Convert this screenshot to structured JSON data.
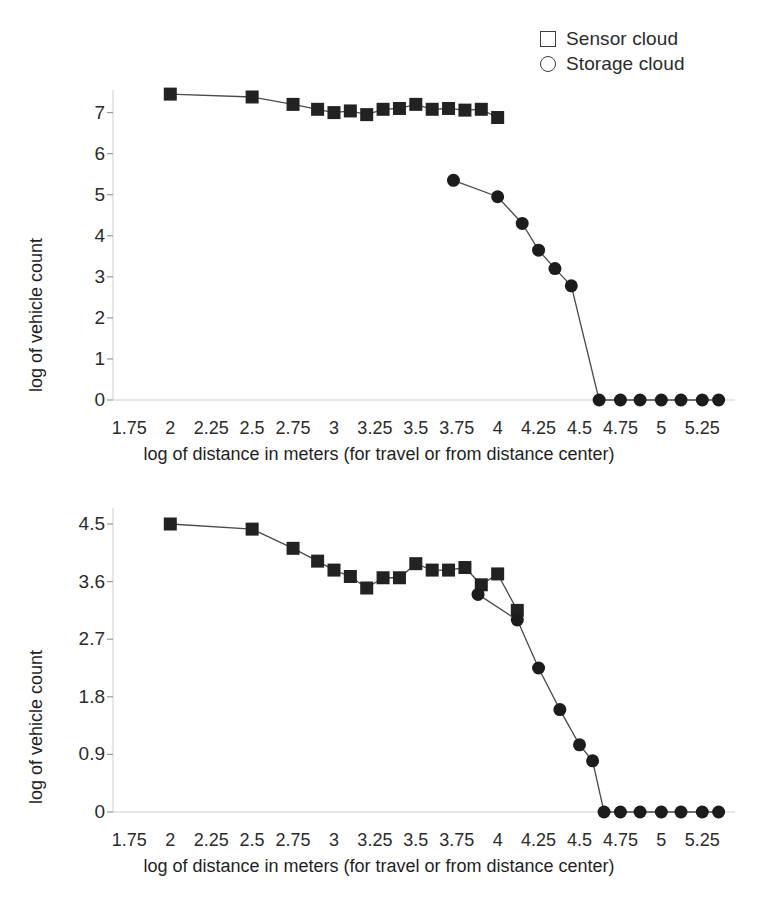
{
  "legend": {
    "position": "top-right",
    "items": [
      {
        "marker": "square-outline-icon",
        "label": "Sensor cloud"
      },
      {
        "marker": "circle-outline-icon",
        "label": "Storage cloud"
      }
    ]
  },
  "chart_data": [
    {
      "id": "top",
      "type": "line",
      "title": "",
      "xlabel": "log of distance in meters (for travel or from distance center)",
      "ylabel": "log of vehicle count",
      "xlim": [
        1.65,
        5.45
      ],
      "ylim": [
        0,
        7.55
      ],
      "xticks": [
        1.75,
        2,
        2.25,
        2.5,
        2.75,
        3,
        3.25,
        3.5,
        3.75,
        4,
        4.25,
        4.5,
        4.75,
        5,
        5.25
      ],
      "xtick_labels": [
        "1.75",
        "2",
        "2.25",
        "2.5",
        "2.75",
        "3",
        "3.25",
        "3.5",
        "3.75",
        "4",
        "4.25",
        "4.5",
        "4.75",
        "5",
        "5.25"
      ],
      "yticks": [
        0,
        1,
        2,
        3,
        4,
        5,
        6,
        7
      ],
      "ytick_labels": [
        "0",
        "1",
        "2",
        "3",
        "4",
        "5",
        "6",
        "7"
      ],
      "grid": false,
      "series": [
        {
          "name": "Sensor cloud",
          "marker": "square",
          "x": [
            2.0,
            2.5,
            2.75,
            2.9,
            3.0,
            3.1,
            3.2,
            3.3,
            3.4,
            3.5,
            3.6,
            3.7,
            3.8,
            3.9,
            4.0
          ],
          "y": [
            7.45,
            7.38,
            7.2,
            7.08,
            7.0,
            7.04,
            6.95,
            7.08,
            7.1,
            7.2,
            7.08,
            7.1,
            7.06,
            7.08,
            6.88
          ]
        },
        {
          "name": "Storage cloud",
          "marker": "circle",
          "x": [
            3.73,
            4.0,
            4.15,
            4.25,
            4.35,
            4.45,
            4.62,
            4.75,
            4.87,
            5.0,
            5.12,
            5.25,
            5.35
          ],
          "y": [
            5.35,
            4.95,
            4.3,
            3.65,
            3.2,
            2.78,
            0.0,
            0.0,
            0.0,
            0.0,
            0.0,
            0.0,
            0.0
          ]
        }
      ]
    },
    {
      "id": "bottom",
      "type": "line",
      "title": "",
      "xlabel": "log of distance in meters (for travel or from distance center)",
      "ylabel": "log of vehicle count",
      "xlim": [
        1.65,
        5.45
      ],
      "ylim": [
        0,
        4.75
      ],
      "xticks": [
        1.75,
        2,
        2.25,
        2.5,
        2.75,
        3,
        3.25,
        3.5,
        3.75,
        4,
        4.25,
        4.5,
        4.75,
        5,
        5.25
      ],
      "xtick_labels": [
        "1.75",
        "2",
        "2.25",
        "2.5",
        "2.75",
        "3",
        "3.25",
        "3.5",
        "3.75",
        "4",
        "4.25",
        "4.5",
        "4.75",
        "5",
        "5.25"
      ],
      "yticks": [
        0,
        0.9,
        1.8,
        2.7,
        3.6,
        4.5
      ],
      "ytick_labels": [
        "0",
        "0.9",
        "1.8",
        "2.7",
        "3.6",
        "4.5"
      ],
      "grid": false,
      "series": [
        {
          "name": "Sensor cloud",
          "marker": "square",
          "x": [
            2.0,
            2.5,
            2.75,
            2.9,
            3.0,
            3.1,
            3.2,
            3.3,
            3.4,
            3.5,
            3.6,
            3.7,
            3.8,
            3.9,
            4.0,
            4.12
          ],
          "y": [
            4.5,
            4.42,
            4.12,
            3.92,
            3.78,
            3.68,
            3.5,
            3.66,
            3.66,
            3.88,
            3.78,
            3.78,
            3.82,
            3.55,
            3.72,
            3.15
          ]
        },
        {
          "name": "Storage cloud",
          "marker": "circle",
          "x": [
            3.88,
            4.12,
            4.25,
            4.38,
            4.5,
            4.58,
            4.65,
            4.75,
            4.87,
            5.0,
            5.12,
            5.25,
            5.35
          ],
          "y": [
            3.4,
            3.0,
            2.25,
            1.6,
            1.05,
            0.8,
            0.0,
            0.0,
            0.0,
            0.0,
            0.0,
            0.0,
            0.0
          ]
        }
      ]
    }
  ]
}
